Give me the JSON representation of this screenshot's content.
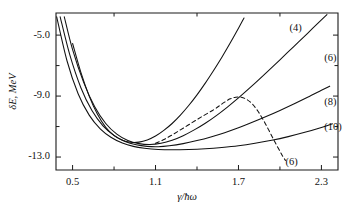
{
  "chart_data": {
    "type": "line",
    "title": "",
    "xlabel": "γ/ħω",
    "ylabel": "δE, MeV",
    "xlim": [
      0.38,
      2.42
    ],
    "ylim": [
      -13.85,
      -3.55
    ],
    "grid": false,
    "legend_position": "inline-right",
    "xticks": [
      0.5,
      1.1,
      1.7,
      2.3
    ],
    "xticklabels": [
      "0.5",
      "1.1",
      "1.7",
      "2.3"
    ],
    "xminorticks": [
      0.8,
      1.4,
      2.0
    ],
    "yticks": [
      -5.0,
      -9.0,
      -13.0
    ],
    "yticklabels": [
      "-5.0",
      "-9.0",
      "-13.0"
    ],
    "yminorticks": [
      -7.0,
      -11.0
    ],
    "series": [
      {
        "name": "(4)",
        "label": "(4)",
        "style": "solid",
        "label_x": 2.07,
        "label_y": -4.55,
        "points": [
          [
            0.5,
            -5.55
          ],
          [
            0.56,
            -7.45
          ],
          [
            0.62,
            -9.0
          ],
          [
            0.68,
            -10.2
          ],
          [
            0.74,
            -11.05
          ],
          [
            0.8,
            -11.6
          ],
          [
            0.86,
            -11.9
          ],
          [
            0.92,
            -12.03
          ],
          [
            0.98,
            -12.02
          ],
          [
            1.04,
            -11.88
          ],
          [
            1.1,
            -11.62
          ],
          [
            1.16,
            -11.25
          ],
          [
            1.22,
            -10.8
          ],
          [
            1.28,
            -10.25
          ],
          [
            1.34,
            -9.62
          ],
          [
            1.4,
            -8.92
          ],
          [
            1.46,
            -8.15
          ],
          [
            1.52,
            -7.32
          ],
          [
            1.58,
            -6.45
          ],
          [
            1.64,
            -5.52
          ],
          [
            1.7,
            -4.55
          ],
          [
            1.74,
            -3.88
          ]
        ]
      },
      {
        "name": "(6)",
        "label": "(6)",
        "style": "solid",
        "label_x": 2.32,
        "label_y": -6.55,
        "points": [
          [
            0.44,
            -3.8
          ],
          [
            0.5,
            -5.95
          ],
          [
            0.58,
            -8.1
          ],
          [
            0.66,
            -9.7
          ],
          [
            0.74,
            -10.8
          ],
          [
            0.82,
            -11.5
          ],
          [
            0.9,
            -11.92
          ],
          [
            0.98,
            -12.12
          ],
          [
            1.06,
            -12.18
          ],
          [
            1.14,
            -12.1
          ],
          [
            1.22,
            -11.9
          ],
          [
            1.3,
            -11.6
          ],
          [
            1.38,
            -11.22
          ],
          [
            1.46,
            -10.78
          ],
          [
            1.54,
            -10.28
          ],
          [
            1.62,
            -9.72
          ],
          [
            1.7,
            -9.12
          ],
          [
            1.8,
            -8.32
          ],
          [
            1.9,
            -7.48
          ],
          [
            2.0,
            -6.62
          ],
          [
            2.1,
            -5.75
          ],
          [
            2.2,
            -4.88
          ],
          [
            2.3,
            -4.0
          ],
          [
            2.34,
            -3.65
          ]
        ]
      },
      {
        "name": "(8)",
        "label": "(8)",
        "style": "solid",
        "label_x": 2.32,
        "label_y": -9.45,
        "points": [
          [
            0.41,
            -3.8
          ],
          [
            0.48,
            -6.3
          ],
          [
            0.56,
            -8.45
          ],
          [
            0.64,
            -9.95
          ],
          [
            0.72,
            -10.95
          ],
          [
            0.8,
            -11.58
          ],
          [
            0.88,
            -11.98
          ],
          [
            0.96,
            -12.2
          ],
          [
            1.04,
            -12.3
          ],
          [
            1.12,
            -12.32
          ],
          [
            1.2,
            -12.26
          ],
          [
            1.3,
            -12.12
          ],
          [
            1.4,
            -11.92
          ],
          [
            1.5,
            -11.68
          ],
          [
            1.6,
            -11.4
          ],
          [
            1.7,
            -11.08
          ],
          [
            1.8,
            -10.72
          ],
          [
            1.9,
            -10.34
          ],
          [
            2.0,
            -9.94
          ],
          [
            2.1,
            -9.52
          ],
          [
            2.2,
            -9.08
          ],
          [
            2.3,
            -8.62
          ],
          [
            2.36,
            -8.35
          ]
        ]
      },
      {
        "name": "(10)",
        "label": "(10)",
        "style": "solid",
        "label_x": 2.32,
        "label_y": -11.05,
        "points": [
          [
            0.385,
            -3.8
          ],
          [
            0.46,
            -6.7
          ],
          [
            0.54,
            -8.85
          ],
          [
            0.62,
            -10.25
          ],
          [
            0.7,
            -11.15
          ],
          [
            0.78,
            -11.72
          ],
          [
            0.86,
            -12.08
          ],
          [
            0.94,
            -12.3
          ],
          [
            1.02,
            -12.42
          ],
          [
            1.12,
            -12.5
          ],
          [
            1.22,
            -12.52
          ],
          [
            1.34,
            -12.5
          ],
          [
            1.46,
            -12.45
          ],
          [
            1.58,
            -12.37
          ],
          [
            1.7,
            -12.26
          ],
          [
            1.82,
            -12.1
          ],
          [
            1.94,
            -11.9
          ],
          [
            2.06,
            -11.66
          ],
          [
            2.18,
            -11.38
          ],
          [
            2.3,
            -11.06
          ],
          [
            2.38,
            -10.82
          ]
        ]
      },
      {
        "name": "(6)-dashed",
        "label": "(6)",
        "style": "dashed",
        "label_x": 2.04,
        "label_y": -13.35,
        "points": [
          [
            1.1,
            -12.1
          ],
          [
            1.16,
            -11.85
          ],
          [
            1.22,
            -11.55
          ],
          [
            1.28,
            -11.22
          ],
          [
            1.34,
            -10.88
          ],
          [
            1.4,
            -10.54
          ],
          [
            1.46,
            -10.22
          ],
          [
            1.52,
            -9.9
          ],
          [
            1.56,
            -9.65
          ],
          [
            1.6,
            -9.4
          ],
          [
            1.64,
            -9.18
          ],
          [
            1.68,
            -9.08
          ],
          [
            1.72,
            -9.08
          ],
          [
            1.76,
            -9.22
          ],
          [
            1.8,
            -9.52
          ],
          [
            1.84,
            -9.98
          ],
          [
            1.88,
            -10.58
          ],
          [
            1.92,
            -11.25
          ],
          [
            1.96,
            -11.95
          ],
          [
            2.0,
            -12.62
          ],
          [
            2.02,
            -12.95
          ],
          [
            2.04,
            -13.22
          ]
        ]
      }
    ]
  },
  "axes": {
    "y_axis_label": "δE, MeV",
    "x_axis_label": "γ/ħω"
  }
}
